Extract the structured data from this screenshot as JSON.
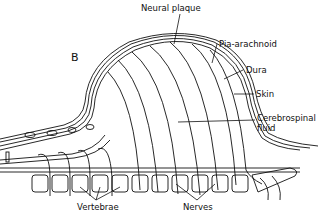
{
  "figure": {
    "panel_letter": "B",
    "labels": {
      "neural_plaque": "Neural plaque",
      "pia_arachnoid": "Pia-arachnoid",
      "dura": "Dura",
      "skin": "Skin",
      "csf_line1": "Cerebrospinal",
      "csf_line2": "fluid",
      "vertebrae": "Vertebrae",
      "nerves": "Nerves"
    },
    "colors": {
      "line": "#111111",
      "background": "#ffffff"
    }
  }
}
